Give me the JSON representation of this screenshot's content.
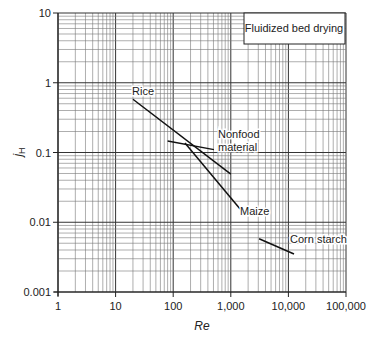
{
  "chart_data": {
    "type": "line",
    "title": "Fluidized bed drying",
    "xlabel": "Re",
    "ylabel": "jH",
    "ylabel_main": "j",
    "ylabel_sub": "H",
    "xscale": "log",
    "yscale": "log",
    "xlim": [
      1,
      100000
    ],
    "ylim": [
      0.001,
      10
    ],
    "grid": true,
    "x_ticks": [
      1,
      10,
      100,
      1000,
      10000,
      100000
    ],
    "x_tick_labels": [
      "1",
      "10",
      "100",
      "1,000",
      "10,000",
      "100,000"
    ],
    "y_ticks": [
      0.001,
      0.01,
      0.1,
      1,
      10
    ],
    "y_tick_labels": [
      "0.001",
      "0.01",
      "0.1",
      "1",
      "10"
    ],
    "legend_position": "top-right box",
    "series": [
      {
        "name": "Rice",
        "x": [
          20,
          1000
        ],
        "y": [
          0.58,
          0.049
        ],
        "label_pos": {
          "x": 132,
          "y": 95
        }
      },
      {
        "name": "Nonfood material",
        "label_lines": [
          "Nonfood",
          "material"
        ],
        "x": [
          80,
          510
        ],
        "y": [
          0.146,
          0.11
        ],
        "label_pos": {
          "x": 218,
          "y": 138
        }
      },
      {
        "name": "Maize",
        "x": [
          160,
          1450
        ],
        "y": [
          0.137,
          0.0155
        ],
        "label_pos": {
          "x": 240,
          "y": 215
        }
      },
      {
        "name": "Corn starch",
        "x": [
          3100,
          12500
        ],
        "y": [
          0.0058,
          0.0035
        ],
        "label_pos": {
          "x": 290,
          "y": 243
        }
      }
    ]
  }
}
